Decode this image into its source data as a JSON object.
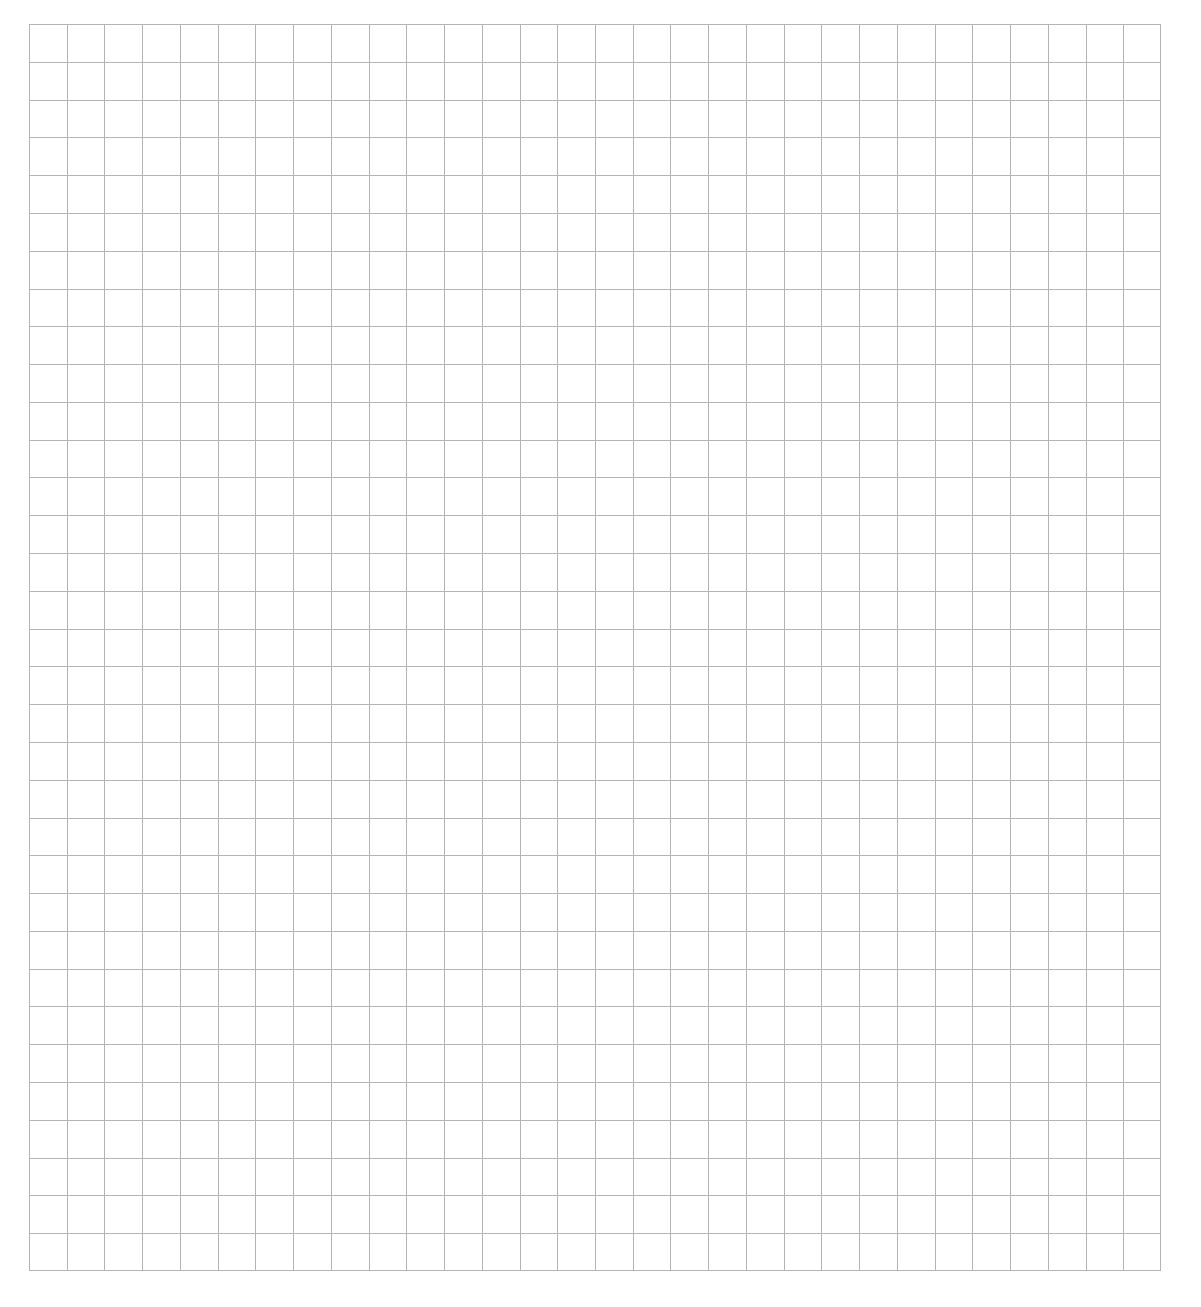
{
  "page": {
    "background": "#ffffff"
  },
  "grid": {
    "columns": 30,
    "rows": 33,
    "cell_width_px": 37.73,
    "cell_height_px": 37.79,
    "line_color": "#b4b4b4",
    "line_width_px": 1,
    "origin": {
      "x": 29,
      "y": 24
    },
    "size": {
      "width": 1132,
      "height": 1247
    }
  }
}
